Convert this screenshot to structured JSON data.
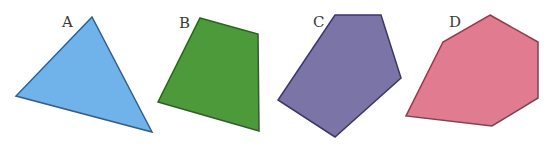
{
  "shapes": [
    {
      "label": "A",
      "kind": "triangle",
      "fill": "#6fb3ea",
      "stroke": "#2f5f95",
      "points": "92,17 16,96 152,132",
      "label_pos": [
        62,
        27
      ]
    },
    {
      "label": "B",
      "kind": "quadrilateral",
      "fill": "#4c9a3a",
      "stroke": "#2e5f25",
      "points": "200,18 258,34 259,131 158,102",
      "label_pos": [
        179,
        28
      ]
    },
    {
      "label": "C",
      "kind": "pentagon",
      "fill": "#7b74a6",
      "stroke": "#3c3768",
      "points": "335,15 381,15 401,78 335,137 278,100",
      "label_pos": [
        313,
        27
      ]
    },
    {
      "label": "D",
      "kind": "hexagon",
      "fill": "#e07b90",
      "stroke": "#8a3e4c",
      "points": "490,15 538,42 538,98 492,126 406,116 443,42",
      "label_pos": [
        449,
        27
      ]
    }
  ]
}
